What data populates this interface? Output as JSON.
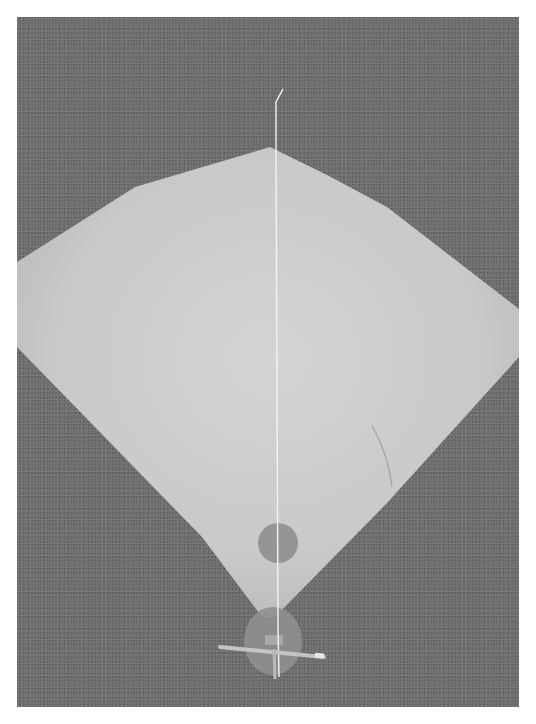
{
  "image": {
    "subject": "paper kite on carpet",
    "colors": {
      "border": "#ffffff",
      "background": "#6a6a6a",
      "kite_paper": "#cfcfcf",
      "circles": "#8f8f8f",
      "string": "#f2f2f2",
      "stick": "#bdbdbd"
    }
  }
}
